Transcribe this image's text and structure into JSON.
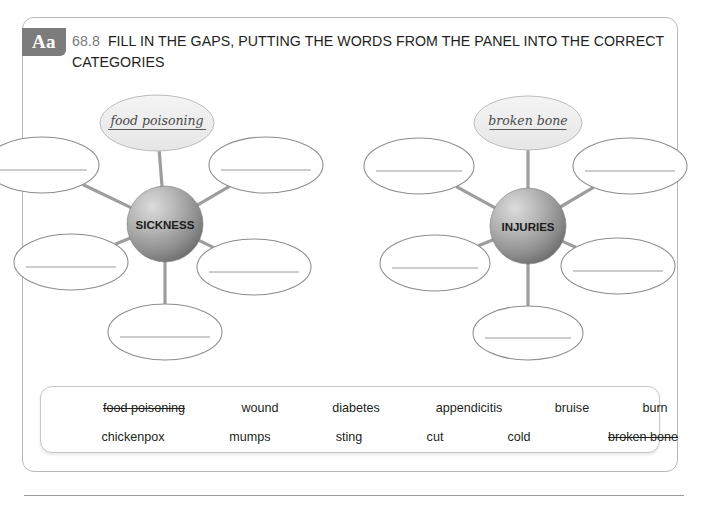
{
  "header": {
    "badge": "Aa",
    "number": "68.8",
    "instruction": "FILL IN THE GAPS, PUTTING THE WORDS FROM THE PANEL INTO THE CORRECT CATEGORIES"
  },
  "colors": {
    "card_border": "#b9b9b9",
    "badge_bg": "#7c7c7c",
    "number_text": "#7b7b7b",
    "body_text": "#231f20",
    "ellipse_stroke": "#8d8d8d",
    "answer_line": "#9a9a9a",
    "spoke": "#9d9d9d",
    "node_sphere_light": "#d7d7d7",
    "node_sphere_dark": "#7e7e7e",
    "filled_ellipse_bg": "#efefef",
    "handwriting": "#4a4a4a"
  },
  "diagrams": [
    {
      "id": "sickness",
      "center_label": "SICKNESS",
      "center": {
        "x": 165,
        "y": 224,
        "r": 38
      },
      "branches": [
        {
          "name": "top",
          "cx": 157,
          "cy": 123,
          "rx": 57,
          "ry": 28,
          "filled": true,
          "answer": "food poisoning"
        },
        {
          "name": "upper-left",
          "cx": 42,
          "cy": 165,
          "rx": 57,
          "ry": 28,
          "filled": false,
          "answer": ""
        },
        {
          "name": "upper-right",
          "cx": 266,
          "cy": 165,
          "rx": 57,
          "ry": 28,
          "filled": false,
          "answer": ""
        },
        {
          "name": "lower-left",
          "cx": 71,
          "cy": 262,
          "rx": 57,
          "ry": 28,
          "filled": false,
          "answer": ""
        },
        {
          "name": "lower-right",
          "cx": 254,
          "cy": 267,
          "rx": 57,
          "ry": 28,
          "filled": false,
          "answer": ""
        },
        {
          "name": "bottom",
          "cx": 165,
          "cy": 332,
          "rx": 57,
          "ry": 28,
          "filled": false,
          "answer": ""
        }
      ]
    },
    {
      "id": "injuries",
      "center_label": "INJURIES",
      "center": {
        "x": 528,
        "y": 226,
        "r": 38
      },
      "branches": [
        {
          "name": "top",
          "cx": 528,
          "cy": 123,
          "rx": 54,
          "ry": 27,
          "filled": true,
          "answer": "broken bone"
        },
        {
          "name": "upper-left",
          "cx": 419,
          "cy": 166,
          "rx": 55,
          "ry": 28,
          "filled": false,
          "answer": ""
        },
        {
          "name": "upper-right",
          "cx": 630,
          "cy": 166,
          "rx": 57,
          "ry": 28,
          "filled": false,
          "answer": ""
        },
        {
          "name": "lower-left",
          "cx": 435,
          "cy": 263,
          "rx": 55,
          "ry": 28,
          "filled": false,
          "answer": ""
        },
        {
          "name": "lower-right",
          "cx": 618,
          "cy": 266,
          "rx": 57,
          "ry": 28,
          "filled": false,
          "answer": ""
        },
        {
          "name": "bottom",
          "cx": 528,
          "cy": 333,
          "rx": 55,
          "ry": 27,
          "filled": false,
          "answer": ""
        }
      ]
    }
  ],
  "word_panel": {
    "rows": [
      [
        {
          "label": "food poisoning",
          "used": true,
          "x": 103
        },
        {
          "label": "wound",
          "used": false,
          "x": 219
        },
        {
          "label": "diabetes",
          "used": false,
          "x": 315
        },
        {
          "label": "appendicitis",
          "used": false,
          "x": 428
        },
        {
          "label": "bruise",
          "used": false,
          "x": 531
        },
        {
          "label": "burn",
          "used": false,
          "x": 614
        }
      ],
      [
        {
          "label": "chickenpox",
          "used": false,
          "x": 92
        },
        {
          "label": "mumps",
          "used": false,
          "x": 209
        },
        {
          "label": "sting",
          "used": false,
          "x": 308
        },
        {
          "label": "cut",
          "used": false,
          "x": 394
        },
        {
          "label": "cold",
          "used": false,
          "x": 478
        },
        {
          "label": "broken bone",
          "used": true,
          "x": 602
        }
      ]
    ]
  }
}
